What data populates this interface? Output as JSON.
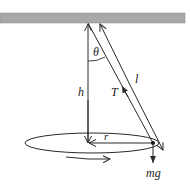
{
  "diagram": {
    "labels": {
      "theta": "θ",
      "length": "l",
      "height": "h",
      "tension": "T",
      "radius": "r",
      "weight": "mg"
    },
    "colors": {
      "ceiling": "#a8a8a8",
      "line": "#2a2a2a",
      "background": "#ffffff"
    }
  }
}
